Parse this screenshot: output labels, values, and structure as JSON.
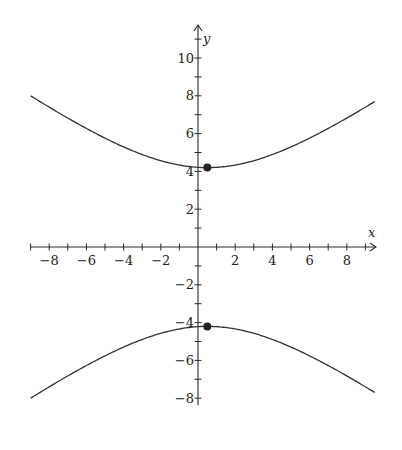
{
  "chart_data": {
    "type": "line",
    "title": "",
    "xlabel": "x",
    "ylabel": "y",
    "xlim": [
      -9,
      9.5
    ],
    "ylim": [
      -8.5,
      11.5
    ],
    "x_ticks_labeled": [
      -8,
      -6,
      -4,
      -2,
      2,
      4,
      6,
      8
    ],
    "y_ticks_labeled": [
      10,
      8,
      6,
      4,
      2,
      -2,
      -4,
      -6,
      -8
    ],
    "minor_tick_step": 1,
    "grid": false,
    "legend": null,
    "series": [
      {
        "name": "upper branch",
        "description": "hyperbola (y^2/4.2^2) - ((x-0.5)^2/5.86^2) = 1, upper",
        "center_x": 0.5,
        "a": 4.2,
        "b": 5.86,
        "x": [
          -9,
          -6,
          -4,
          -2,
          0.5,
          2,
          4,
          6,
          8,
          9.5
        ],
        "y": [
          8.0,
          6.6,
          5.8,
          4.8,
          4.2,
          4.3,
          4.9,
          5.8,
          7.0,
          7.9
        ]
      },
      {
        "name": "lower branch",
        "description": "hyperbola lower branch, mirror of upper across x-axis",
        "center_x": 0.5,
        "a": 4.2,
        "b": 5.86,
        "x": [
          -9,
          -6,
          -4,
          -2,
          0.5,
          2,
          4,
          6,
          8,
          9.5
        ],
        "y": [
          -8.0,
          -6.6,
          -5.8,
          -4.8,
          -4.2,
          -4.3,
          -4.9,
          -5.8,
          -7.0,
          -7.9
        ]
      }
    ],
    "points": [
      {
        "x": 0.5,
        "y": 4.2,
        "label": "vertex upper"
      },
      {
        "x": 0.5,
        "y": -4.2,
        "label": "vertex lower"
      }
    ]
  },
  "layout": {
    "origin_px": [
      198,
      247
    ],
    "scale_x": 18.6,
    "scale_y": 18.9,
    "x_axis_px": [
      30,
      376
    ],
    "y_axis_px": [
      25,
      405
    ]
  },
  "labels": {
    "x_axis": "x",
    "y_axis": "y"
  }
}
